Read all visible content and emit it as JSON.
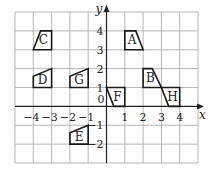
{
  "diagram": {
    "title": "",
    "axes": {
      "x_label": "x",
      "y_label": "y",
      "origin_label": "0",
      "x_range": [
        -5,
        5
      ],
      "y_range": [
        -3,
        5
      ],
      "x_ticks": [
        {
          "value": -4,
          "label": "−4"
        },
        {
          "value": -3,
          "label": "−3"
        },
        {
          "value": -2,
          "label": "−2"
        },
        {
          "value": -1,
          "label": "−1"
        },
        {
          "value": 1,
          "label": "1"
        },
        {
          "value": 2,
          "label": "2"
        },
        {
          "value": 3,
          "label": "3"
        },
        {
          "value": 4,
          "label": "4"
        }
      ],
      "y_ticks": [
        {
          "value": 4,
          "label": "4"
        },
        {
          "value": 3,
          "label": "3"
        },
        {
          "value": 2,
          "label": "2"
        },
        {
          "value": 1,
          "label": "1"
        },
        {
          "value": -1,
          "label": "−1"
        },
        {
          "value": -2,
          "label": "−2"
        }
      ]
    },
    "shapes": [
      {
        "label": "A",
        "points": [
          [
            1,
            4
          ],
          [
            1.6,
            4
          ],
          [
            2,
            3
          ],
          [
            1,
            3
          ]
        ],
        "label_pos": [
          1.4,
          3.5
        ]
      },
      {
        "label": "B",
        "points": [
          [
            2,
            2
          ],
          [
            2.5,
            2
          ],
          [
            3,
            1
          ],
          [
            2,
            1
          ]
        ],
        "label_pos": [
          2.4,
          1.5
        ]
      },
      {
        "label": "C",
        "points": [
          [
            -4,
            3
          ],
          [
            -3.6,
            4
          ],
          [
            -3,
            4
          ],
          [
            -3,
            3
          ]
        ],
        "label_pos": [
          -3.45,
          3.5
        ]
      },
      {
        "label": "D",
        "points": [
          [
            -4,
            1
          ],
          [
            -4,
            1.6
          ],
          [
            -3,
            2
          ],
          [
            -3,
            1
          ]
        ],
        "label_pos": [
          -3.5,
          1.4
        ]
      },
      {
        "label": "E",
        "points": [
          [
            -2,
            -2
          ],
          [
            -2,
            -1.4
          ],
          [
            -1,
            -1
          ],
          [
            -1,
            -2
          ]
        ],
        "label_pos": [
          -1.5,
          -1.6
        ]
      },
      {
        "label": "F",
        "points": [
          [
            0,
            1
          ],
          [
            1,
            1
          ],
          [
            1,
            0
          ],
          [
            0.4,
            0
          ]
        ],
        "label_pos": [
          0.6,
          0.5
        ]
      },
      {
        "label": "G",
        "points": [
          [
            -2,
            1
          ],
          [
            -2,
            1.6
          ],
          [
            -1,
            2
          ],
          [
            -1,
            1
          ]
        ],
        "label_pos": [
          -1.5,
          1.4
        ]
      },
      {
        "label": "H",
        "points": [
          [
            3,
            1
          ],
          [
            4,
            1
          ],
          [
            4,
            0
          ],
          [
            3.4,
            0
          ]
        ],
        "label_pos": [
          3.6,
          0.5
        ]
      }
    ]
  }
}
